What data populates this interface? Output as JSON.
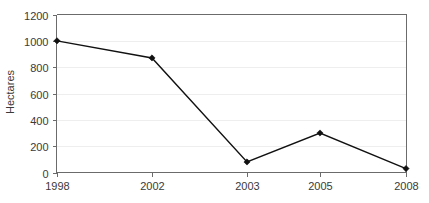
{
  "chart_data": {
    "type": "line",
    "title": "",
    "xlabel": "",
    "ylabel": "Hectares",
    "categories": [
      "1998",
      "2002",
      "2003",
      "2005",
      "2008"
    ],
    "values": [
      1000,
      870,
      80,
      300,
      30
    ],
    "series": [
      {
        "name": "Hectares",
        "values": [
          1000,
          870,
          80,
          300,
          30
        ]
      }
    ],
    "ylim": [
      0,
      1200
    ],
    "ytick_labels": [
      "0",
      "200",
      "400",
      "600",
      "800",
      "1000",
      "1200"
    ],
    "ytick_values": [
      0,
      200,
      400,
      600,
      800,
      1000,
      1200
    ],
    "grid": true,
    "grid_axis": "y",
    "legend": "none",
    "marker": "filled-diamond",
    "line_color": "#111111",
    "grid_color": "#eeeeee",
    "axis_color": "#6b6b6b",
    "background_color": "#ffffff"
  },
  "axes": {
    "y_title": "Hectares"
  }
}
